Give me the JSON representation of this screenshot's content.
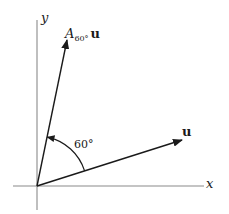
{
  "figure": {
    "colors": {
      "background": "#ffffff",
      "axis": "#8a8a8a",
      "vector": "#1a1a1a",
      "text": "#1a1a1a"
    },
    "axes": {
      "x_label": "x",
      "y_label": "y",
      "origin_px": [
        37,
        186
      ]
    },
    "vectors": [
      {
        "name": "u",
        "label": "u",
        "start_px": [
          37,
          186
        ],
        "end_px": [
          182,
          140
        ],
        "angle_deg_approx": 17.6
      },
      {
        "name": "A60u",
        "label_symbol": "A",
        "label_subscript": "60°",
        "label_vector": "u",
        "start_px": [
          37,
          186
        ],
        "end_px": [
          67,
          40
        ],
        "angle_deg_approx": 78.4
      }
    ],
    "rotation_arc": {
      "label": "60°",
      "from": "u",
      "to": "A60u",
      "direction": "counterclockwise"
    }
  }
}
